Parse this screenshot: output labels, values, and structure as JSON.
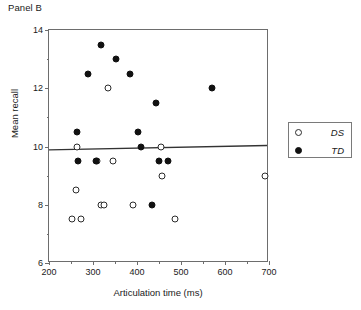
{
  "panel": {
    "title": "Panel B"
  },
  "legend": {
    "position": "right-outside",
    "entries": [
      {
        "label": "DS",
        "marker": "open-circle",
        "color": "#ffffff",
        "edge": "#2b2b2b"
      },
      {
        "label": "TD",
        "marker": "filled-circle",
        "color": "#111111",
        "edge": "#111111"
      }
    ]
  },
  "axes": {
    "x_ticks": [
      "200",
      "300",
      "400",
      "500",
      "600",
      "700"
    ],
    "y_ticks": [
      "6",
      "8",
      "10",
      "12",
      "14"
    ]
  },
  "colors": {
    "frame": "#6d6d6d",
    "text": "#1a1a1a",
    "td_fill": "#111111",
    "ds_fill": "#ffffff",
    "ds_edge": "#2b2b2b",
    "trend": "#333333"
  },
  "chart_data": {
    "type": "scatter",
    "title": "Panel B",
    "xlabel": "Articulation time (ms)",
    "ylabel": "Mean recall",
    "xlim": [
      200,
      700
    ],
    "ylim": [
      6,
      14
    ],
    "xticks": [
      200,
      300,
      400,
      500,
      600,
      700
    ],
    "yticks": [
      6,
      8,
      10,
      12,
      14
    ],
    "x_minor_ticks": [
      250,
      350,
      450,
      550,
      650
    ],
    "y_minor_ticks": [
      7,
      9,
      11,
      13
    ],
    "grid": false,
    "legend_position": "right-outside",
    "series": [
      {
        "name": "DS",
        "marker": "open-circle",
        "points": [
          [
            252,
            7.5
          ],
          [
            262,
            8.5
          ],
          [
            263,
            10.0
          ],
          [
            272,
            7.5
          ],
          [
            308,
            9.5
          ],
          [
            318,
            8.0
          ],
          [
            325,
            8.0
          ],
          [
            333,
            12.0
          ],
          [
            345,
            9.5
          ],
          [
            392,
            8.0
          ],
          [
            455,
            10.0
          ],
          [
            456,
            9.0
          ],
          [
            487,
            7.5
          ],
          [
            690,
            9.0
          ]
        ]
      },
      {
        "name": "TD",
        "marker": "filled-circle",
        "points": [
          [
            263,
            10.5
          ],
          [
            265,
            9.5
          ],
          [
            288,
            12.5
          ],
          [
            306,
            9.5
          ],
          [
            318,
            13.5
          ],
          [
            352,
            13.0
          ],
          [
            383,
            12.5
          ],
          [
            402,
            10.5
          ],
          [
            408,
            10.0
          ],
          [
            435,
            8.0
          ],
          [
            443,
            11.5
          ],
          [
            450,
            9.5
          ],
          [
            470,
            9.5
          ],
          [
            570,
            12.0
          ]
        ]
      }
    ],
    "trend_line": {
      "description": "near-flat regression line across full x range",
      "x_start": 200,
      "y_start": 9.85,
      "x_end": 700,
      "y_end": 10.0
    }
  }
}
